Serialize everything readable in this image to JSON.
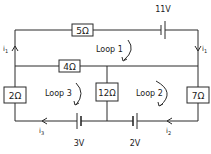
{
  "diagram": {
    "type": "circuit",
    "resistors": {
      "r5": "5Ω",
      "r4": "4Ω",
      "r2": "2Ω",
      "r12": "12Ω",
      "r7": "7Ω"
    },
    "batteries": {
      "b11": "11V",
      "b3": "3V",
      "b2": "2V"
    },
    "loops": {
      "loop1": "Loop 1",
      "loop2": "Loop 2",
      "loop3": "Loop 3"
    },
    "currents": {
      "left_top": "i",
      "left_top_sub": "1",
      "right_top": "i",
      "right_top_sub": "1",
      "bottom_left": "i",
      "bottom_left_sub": "3",
      "bottom_right": "i",
      "bottom_right_sub": "2"
    },
    "colors": {
      "line": "#2a2a2a",
      "background": "#ffffff"
    }
  }
}
